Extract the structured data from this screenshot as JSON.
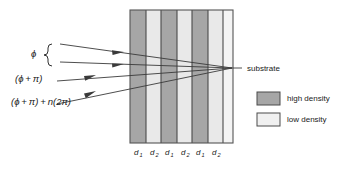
{
  "figure": {
    "background": "#ffffff"
  },
  "rays": [
    {
      "id": "ray-1",
      "label": "ϕ",
      "has_brace": true,
      "arrow_direction": "right"
    },
    {
      "id": "ray-2",
      "label": "",
      "has_brace": true,
      "arrow_direction": "right"
    },
    {
      "id": "ray-3",
      "label": "(ϕ + π)",
      "has_brace": false,
      "arrow_direction": "right"
    },
    {
      "id": "ray-4",
      "label": "(ϕ + π) + n(2π)",
      "has_brace": false,
      "arrow_direction": "right"
    }
  ],
  "phase_labels": {
    "phi": "ϕ",
    "phi_plus_pi": "(ϕ + π)",
    "phi_plus_pi_plus_n2pi": "(ϕ + π) + n(2π)"
  },
  "substrate": {
    "label": "substrate"
  },
  "stack": {
    "layers": [
      {
        "type": "high",
        "thickness_label": "d",
        "thickness_sub": "1",
        "color": "#a6a6a6"
      },
      {
        "type": "low",
        "thickness_label": "d",
        "thickness_sub": "2",
        "color": "#e9e9e9"
      },
      {
        "type": "high",
        "thickness_label": "d",
        "thickness_sub": "1",
        "color": "#a6a6a6"
      },
      {
        "type": "low",
        "thickness_label": "d",
        "thickness_sub": "2",
        "color": "#e9e9e9"
      },
      {
        "type": "high",
        "thickness_label": "d",
        "thickness_sub": "1",
        "color": "#a6a6a6"
      },
      {
        "type": "low",
        "thickness_label": "d",
        "thickness_sub": "2",
        "color": "#e9e9e9"
      },
      {
        "type": "substrate",
        "thickness_label": "",
        "thickness_sub": "",
        "color": "#f4f4f4"
      }
    ],
    "thickness_labels": [
      {
        "base": "d",
        "sub": "1"
      },
      {
        "base": "d",
        "sub": "2"
      },
      {
        "base": "d",
        "sub": "1"
      },
      {
        "base": "d",
        "sub": "2"
      },
      {
        "base": "d",
        "sub": "1"
      },
      {
        "base": "d",
        "sub": "2"
      }
    ]
  },
  "legend": {
    "items": [
      {
        "label": "high density",
        "color": "#a6a6a6",
        "swatch": "swatch-high-density"
      },
      {
        "label": "low density",
        "color": "#f0f0f0",
        "swatch": "swatch-low-density"
      }
    ]
  },
  "colors": {
    "high_density": "#a6a6a6",
    "low_density": "#e9e9e9",
    "substrate_fill": "#f4f4f4",
    "ray_stroke": "#3a3a3a",
    "layer_edge": "#4a4a4a",
    "text": "#1a1a1a"
  }
}
